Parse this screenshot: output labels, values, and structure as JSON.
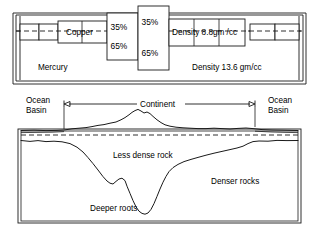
{
  "figure": {
    "top_diagram": {
      "name": "mercury-tank-analogy",
      "container_label": "Mercury",
      "density_labels": {
        "fluid": "Density 13.6 gm/cc",
        "block": "Density 8.8gm /cc"
      },
      "block_labels": [
        "Copper"
      ],
      "percent_labels": {
        "above_left": "35%",
        "below_left": "65%",
        "above_right": "35%",
        "below_right": "65%"
      },
      "waterline": "mercury surface level (dashed)"
    },
    "bottom_diagram": {
      "name": "continental-crust-cross-section",
      "span_label": "Continent",
      "left_margin_label": "Ocean\nBasin",
      "left_margin_line1": "Ocean",
      "left_margin_line2": "Basin",
      "right_margin_line1": "Ocean",
      "right_margin_line2": "Basin",
      "crust_label": "Less dense rock",
      "mantle_label": "Denser rocks",
      "root_label": "Deeper roots",
      "sea_level": "sea level (dashed)"
    },
    "colors": {
      "ink": "#1a1a1a",
      "background": "#ffffff"
    }
  }
}
